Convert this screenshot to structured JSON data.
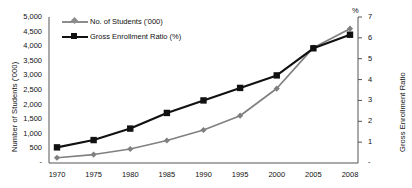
{
  "chart_data": {
    "type": "line",
    "title": "",
    "xlabel": "",
    "ylabel": "Number of Students ('000)",
    "y2label": "Gross Enrollment Ratio",
    "y2_unit_symbol": "%",
    "categories": [
      "1970",
      "1975",
      "1980",
      "1985",
      "1990",
      "1995",
      "2000",
      "2005",
      "2008"
    ],
    "ylim": [
      0,
      5000
    ],
    "y2lim": [
      0,
      7
    ],
    "yticks": [
      "500",
      "1,000",
      "1,500",
      "2,000",
      "2,500",
      "3,000",
      "3,500",
      "4,000",
      "4,500",
      "5,000"
    ],
    "ytick_values": [
      500,
      1000,
      1500,
      2000,
      2500,
      3000,
      3500,
      4000,
      4500,
      5000
    ],
    "y2ticks": [
      "1",
      "2",
      "3",
      "4",
      "5",
      "6",
      "7"
    ],
    "y2tick_values": [
      1,
      2,
      3,
      4,
      5,
      6,
      7
    ],
    "grid": false,
    "legend_position": "top-left",
    "series": [
      {
        "name": "No. of Students ('000)",
        "axis": "left",
        "color": "#808080",
        "marker": "diamond",
        "values": [
          180,
          290,
          480,
          770,
          1130,
          1620,
          2550,
          3950,
          4600
        ]
      },
      {
        "name": "Gross Enrollment Ratio (%)",
        "axis": "right",
        "color": "#111111",
        "marker": "square",
        "values": [
          0.75,
          1.1,
          1.65,
          2.4,
          3.0,
          3.6,
          4.2,
          5.5,
          6.15
        ]
      }
    ]
  },
  "legend": {
    "students_label": "No. of Students ('000)",
    "ger_label": "Gross Enrollment Ratio (%)"
  },
  "axes": {
    "left_title": "Number of Students ('000)",
    "right_title": "Gross Enrollment Ratio",
    "percent_symbol": "%",
    "left_zero_dash": "-",
    "right_zero_dash": "-"
  }
}
